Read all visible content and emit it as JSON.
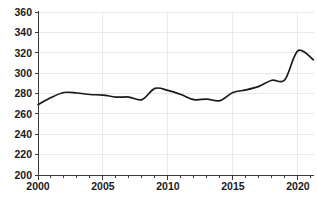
{
  "chart_data": {
    "type": "line",
    "title": "",
    "subtitle": "",
    "xlabel": "",
    "ylabel": "",
    "xlim": [
      2000,
      2021.2
    ],
    "ylim": [
      200,
      360
    ],
    "grid": true,
    "legend": "none",
    "x_tick_labels": [
      "2000",
      "2005",
      "2010",
      "2015",
      "2020"
    ],
    "x_major_ticks": [
      2000,
      2005,
      2010,
      2015,
      2020
    ],
    "x_minor_ticks": [
      2001,
      2002,
      2003,
      2004,
      2006,
      2007,
      2008,
      2009,
      2011,
      2012,
      2013,
      2014,
      2016,
      2017,
      2018,
      2019,
      2021
    ],
    "y_tick_labels": [
      "200",
      "220",
      "240",
      "260",
      "280",
      "300",
      "320",
      "340",
      "360"
    ],
    "y_ticks": [
      200,
      220,
      240,
      260,
      280,
      300,
      320,
      340,
      360
    ],
    "series": [
      {
        "name": "series-1",
        "color": "#1a1a1a",
        "x": [
          2000,
          2001,
          2002,
          2003,
          2004,
          2005,
          2006,
          2007,
          2008,
          2009,
          2010,
          2011,
          2012,
          2013,
          2014,
          2015,
          2016,
          2017,
          2018,
          2019,
          2020,
          2021.2
        ],
        "values": [
          269,
          276,
          281,
          280.5,
          279,
          278.5,
          276.5,
          276.5,
          274,
          285,
          283,
          279,
          274,
          274.5,
          273,
          281,
          283.5,
          287,
          293,
          293.5,
          322,
          313
        ]
      }
    ]
  },
  "axes": {
    "y_axis_name": "y-axis",
    "x_axis_name": "x-axis"
  }
}
